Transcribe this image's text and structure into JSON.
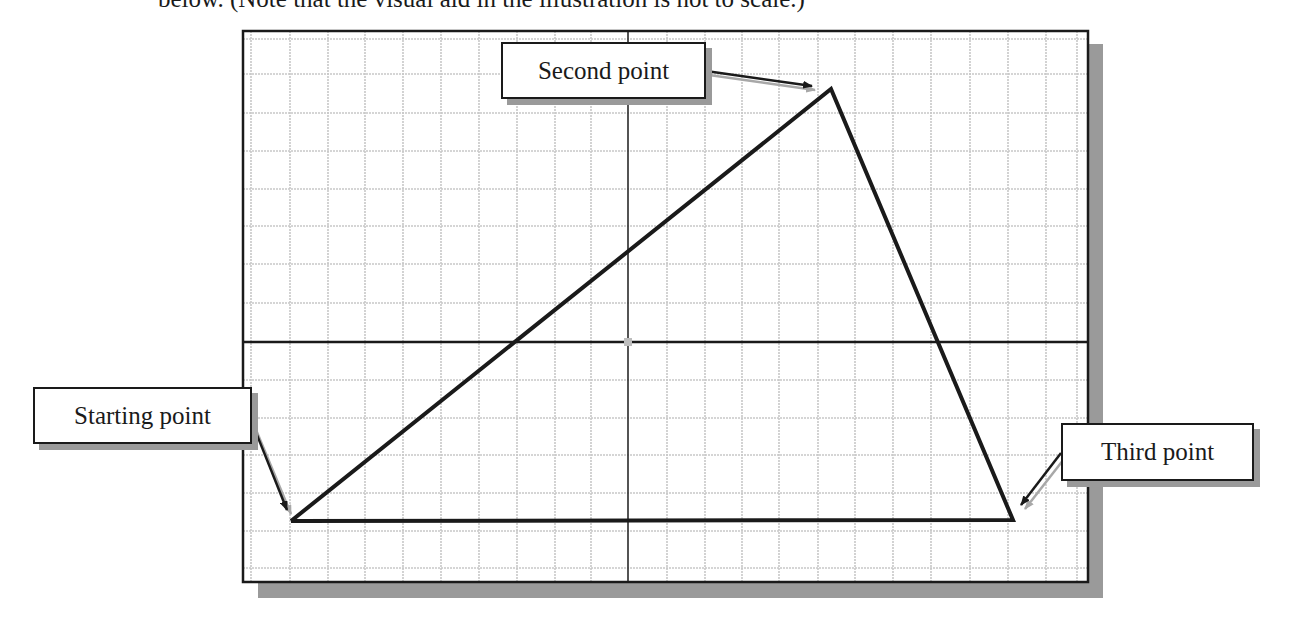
{
  "caption": {
    "text": "below. (Note that the visual aid in the illustration is not to scale.)"
  },
  "diagram": {
    "type": "grid-triangle-construction",
    "labels": {
      "start": "Starting point",
      "second": "Second point",
      "third": "Third point"
    },
    "points": {
      "start": {
        "x": 291,
        "y": 521
      },
      "second": {
        "x": 831,
        "y": 89
      },
      "third": {
        "x": 1013,
        "y": 520
      }
    },
    "colors": {
      "grid": "#c8c8c8",
      "axis": "#1a1a1a",
      "border": "#1a1a1a",
      "shadow": "#9a9a9a",
      "triangle": "#1a1a1a",
      "origin_marker": "#bdbdbd"
    }
  }
}
